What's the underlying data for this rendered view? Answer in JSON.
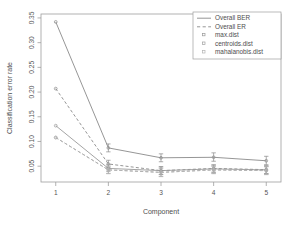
{
  "chart_data": {
    "type": "line",
    "title": "",
    "xlabel": "Component",
    "ylabel": "Classification error rate",
    "x": [
      1,
      2,
      3,
      4,
      5
    ],
    "xticklabels": [
      "1",
      "2",
      "3",
      "4",
      "5"
    ],
    "xlim": [
      0.72,
      5.28
    ],
    "ylim": [
      0.018,
      0.358
    ],
    "yticks": [
      0.05,
      0.1,
      0.15,
      0.2,
      0.25,
      0.3,
      0.35
    ],
    "yticklabels": [
      "0.05",
      "0.10",
      "0.15",
      "0.20",
      "0.25",
      "0.30",
      "0.35"
    ],
    "grid": false,
    "legend_position": "top-right",
    "series": [
      {
        "name": "Overall BER",
        "linestyle": "solid",
        "color": "#8a8a8a",
        "values": [
          0.342,
          0.087,
          0.067,
          0.068,
          0.061
        ],
        "err_low": [
          0.342,
          0.079,
          0.059,
          0.06,
          0.053
        ],
        "err_high": [
          0.342,
          0.095,
          0.075,
          0.077,
          0.07
        ]
      },
      {
        "name": "Overall ER",
        "linestyle": "dashed",
        "color": "#8a8a8a",
        "values": [
          0.207,
          0.0545,
          0.041,
          0.0455,
          0.043
        ],
        "err_low": [
          0.207,
          0.047,
          0.033,
          0.038,
          0.035
        ],
        "err_high": [
          0.207,
          0.062,
          0.049,
          0.053,
          0.051
        ]
      },
      {
        "name": "max.dist",
        "linestyle": "solid",
        "color": "#9a9a9a",
        "values": [
          0.132,
          0.0455,
          0.041,
          0.0445,
          0.0425
        ],
        "err_low": [
          0.132,
          0.039,
          0.033,
          0.037,
          0.035
        ],
        "err_high": [
          0.132,
          0.053,
          0.049,
          0.052,
          0.05
        ]
      },
      {
        "name": "centroids.dist",
        "linestyle": "dashed",
        "color": "#a0a0a0",
        "values": [
          0.108,
          0.0425,
          0.0375,
          0.0425,
          0.041
        ],
        "err_low": [
          0.108,
          0.035,
          0.029,
          0.035,
          0.033
        ],
        "err_high": [
          0.108,
          0.05,
          0.046,
          0.05,
          0.049
        ]
      },
      {
        "name": "mahalanobis.dist",
        "linestyle": "dashed",
        "color": "#b4b4b4",
        "values": [
          0.108,
          0.0425,
          0.0375,
          0.0425,
          0.041
        ],
        "err_low": [
          0.108,
          0.035,
          0.029,
          0.035,
          0.033
        ],
        "err_high": [
          0.108,
          0.05,
          0.046,
          0.05,
          0.049
        ]
      }
    ],
    "legend": [
      {
        "label": "Overall BER",
        "marker": "line-solid",
        "color": "#8a8a8a"
      },
      {
        "label": "Overall ER",
        "marker": "line-dashed",
        "color": "#8a8a8a"
      },
      {
        "label": "max.dist",
        "marker": "point",
        "color": "#9a9a9a"
      },
      {
        "label": "centroids.dist",
        "marker": "point",
        "color": "#a0a0a0"
      },
      {
        "label": "mahalanobis.dist",
        "marker": "point",
        "color": "#b4b4b4"
      }
    ],
    "colors": {
      "frame": "#9e9e9e",
      "text": "#4d4d4d",
      "background": "#ffffff"
    }
  }
}
